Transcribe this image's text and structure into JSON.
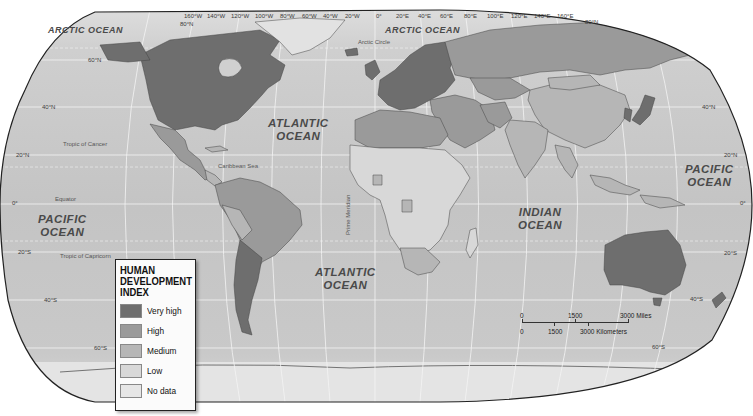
{
  "map": {
    "title": "Human Development Index",
    "projection": "Robinson",
    "colors": {
      "ocean": "#c6c6c6",
      "ocean_light": "#dadada",
      "very_high": "#6e6e6e",
      "high": "#9a9a9a",
      "medium": "#b6b6b6",
      "low": "#d8d8d8",
      "no_data": "#e6e6e6",
      "graticule": "#f2f2f2",
      "border": "#222222"
    },
    "oceans": [
      {
        "name": "arctic-ocean-west",
        "label": "ARCTIC OCEAN"
      },
      {
        "name": "arctic-ocean-east",
        "label": "ARCTIC OCEAN"
      },
      {
        "name": "atlantic-ocean-north",
        "label": "ATLANTIC\nOCEAN"
      },
      {
        "name": "atlantic-ocean-south",
        "label": "ATLANTIC\nOCEAN"
      },
      {
        "name": "pacific-ocean-west",
        "label": "PACIFIC\nOCEAN"
      },
      {
        "name": "pacific-ocean-east",
        "label": "PACIFIC\nOCEAN"
      },
      {
        "name": "indian-ocean",
        "label": "INDIAN\nOCEAN"
      }
    ],
    "features": {
      "arctic_circle": "Arctic Circle",
      "tropic_of_cancer": "Tropic of Cancer",
      "equator": "Equator",
      "tropic_of_capricorn": "Tropic of Capricorn",
      "prime_meridian": "Prime Meridian",
      "caribbean_sea": "Caribbean Sea"
    },
    "longitude_labels": [
      "160°W",
      "140°W",
      "120°W",
      "100°W",
      "80°W",
      "60°W",
      "40°W",
      "20°W",
      "0°",
      "20°E",
      "40°E",
      "60°E",
      "80°E",
      "100°E",
      "120°E",
      "140°E",
      "160°E"
    ],
    "latitude_labels": {
      "north_80": "80°N",
      "north_60": "60°N",
      "north_40": "40°N",
      "north_20": "20°N",
      "equator": "0°",
      "south_20": "20°S",
      "south_40": "40°S",
      "south_60": "60°S"
    }
  },
  "legend": {
    "title_line1": "HUMAN",
    "title_line2": "DEVELOPMENT",
    "title_line3": "INDEX",
    "items": [
      {
        "label": "Very high",
        "color": "#6e6e6e"
      },
      {
        "label": "High",
        "color": "#9a9a9a"
      },
      {
        "label": "Medium",
        "color": "#b6b6b6"
      },
      {
        "label": "Low",
        "color": "#d8d8d8"
      },
      {
        "label": "No data",
        "color": "#e6e6e6"
      }
    ]
  },
  "scale_bar": {
    "miles": {
      "zero": "0",
      "mid": "1500",
      "end": "3000 Miles"
    },
    "km": {
      "zero": "0",
      "mid": "1500",
      "end": "3000 Kilometers"
    }
  }
}
